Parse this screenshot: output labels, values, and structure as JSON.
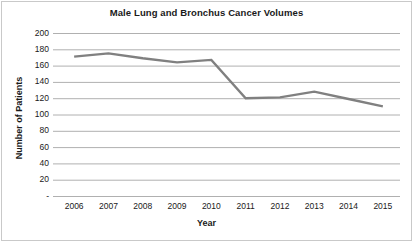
{
  "chart_data": {
    "type": "line",
    "title": "Male Lung and Bronchus Cancer Volumes",
    "xlabel": "Year",
    "ylabel": "Number of Patients",
    "categories": [
      "2006",
      "2007",
      "2008",
      "2009",
      "2010",
      "2011",
      "2012",
      "2013",
      "2014",
      "2015"
    ],
    "x": [
      2006,
      2007,
      2008,
      2009,
      2010,
      2011,
      2012,
      2013,
      2014,
      2015
    ],
    "values": [
      171,
      175,
      169,
      164,
      167,
      120,
      121,
      128,
      119,
      110
    ],
    "series": [
      {
        "name": "Number of Patients",
        "values": [
          171,
          175,
          169,
          164,
          167,
          120,
          121,
          128,
          119,
          110
        ]
      }
    ],
    "ylim": [
      0,
      200
    ],
    "y_ticks": [
      200,
      180,
      160,
      140,
      120,
      100,
      80,
      60,
      40,
      20,
      0
    ],
    "y_tick_labels": [
      "200",
      "180",
      "160",
      "140",
      "120",
      "100",
      "80",
      "60",
      "40",
      "20",
      "-"
    ],
    "grid": true,
    "grid_axis": "y",
    "legend": false,
    "legend_position": "none",
    "markers": false,
    "line_color": "#808080",
    "grid_color": "#b0b0b0",
    "background_color": "#ffffff",
    "text_color": "#1a1a1a"
  }
}
